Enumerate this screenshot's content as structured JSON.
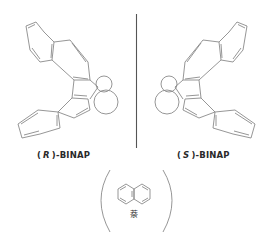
{
  "figure": {
    "left_molecule": {
      "name": "(R)-BINAP",
      "label_open": "(",
      "label_config": "R",
      "label_close": ")-BINAP"
    },
    "right_molecule": {
      "name": "(S)-BINAP",
      "label_open": "(",
      "label_config": "S",
      "label_close": ")-BINAP"
    },
    "bottom_molecule": {
      "caption": "萘"
    },
    "colors": {
      "line": "#8a8a8a",
      "divider": "#555555",
      "text": "#2a2a2a"
    }
  }
}
